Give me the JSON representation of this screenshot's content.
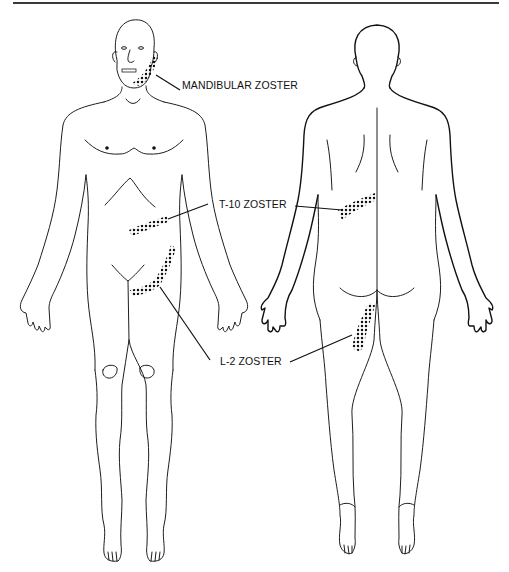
{
  "figure": {
    "views": [
      "anterior",
      "posterior"
    ],
    "labels": {
      "mandibular": "MANDIBULAR ZOSTER",
      "t10": "T-10 ZOSTER",
      "l2": "L-2 ZOSTER"
    },
    "colors": {
      "line": "#1e1e1e",
      "dots": "#111111",
      "background": "#ffffff",
      "rule": "#3a3a3a"
    }
  }
}
